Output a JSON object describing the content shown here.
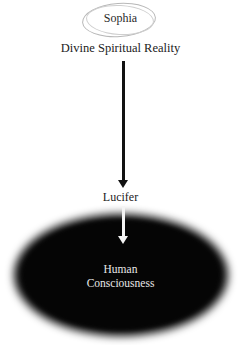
{
  "diagram": {
    "top_node": {
      "label": "Sophia",
      "shape": "hand-drawn-ellipse",
      "color": "#b8b8b8"
    },
    "subtitle": "Divine Spiritual Reality",
    "arrow_1": {
      "direction": "down",
      "color": "#111111"
    },
    "middle_node": {
      "label": "Lucifer"
    },
    "arrow_2": {
      "direction": "down",
      "color": "#f4f4f4"
    },
    "bottom_node": {
      "line1": "Human",
      "line2": "Consciousness",
      "shape": "blurred-black-ellipse",
      "fill": "#0c0c0c",
      "text_color": "#e8e8e8"
    }
  }
}
